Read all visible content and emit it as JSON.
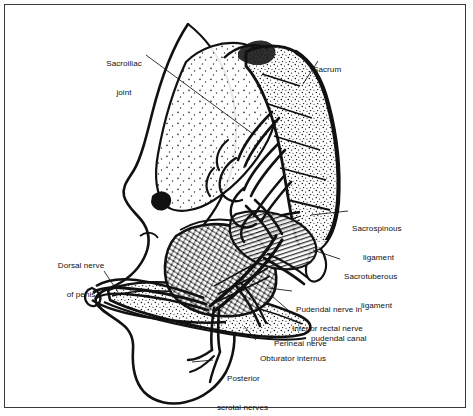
{
  "figure": {
    "kind": "anatomical-line-drawing",
    "title_visible": false,
    "palette": {
      "ink": "#111111",
      "paper": "#ffffff",
      "frame": "#3a3a3a"
    }
  },
  "labels": [
    {
      "id": "sacroiliac-joint",
      "line1": "Sacroiliac",
      "line2": "joint"
    },
    {
      "id": "sacrum",
      "line1": "Sacrum",
      "line2": ""
    },
    {
      "id": "sacrospinous-ligament",
      "line1": "Sacrospinous",
      "line2": "ligament"
    },
    {
      "id": "sacrotuberous-ligament",
      "line1": "Sacrotuberous",
      "line2": "ligament"
    },
    {
      "id": "dorsal-nerve-of-penis",
      "line1": "Dorsal nerve",
      "line2": "of penis"
    },
    {
      "id": "pudendal-nerve",
      "line1": "Pudendal nerve in",
      "line2": "pudendal canal"
    },
    {
      "id": "inferior-rectal-nerve",
      "line1": "Inferior rectal nerve",
      "line2": ""
    },
    {
      "id": "perineal-nerve",
      "line1": "Perineal nerve",
      "line2": ""
    },
    {
      "id": "obturator-internus",
      "line1": "Obturator internus",
      "line2": ""
    },
    {
      "id": "posterior-scrotal-nerves",
      "line1": "Posterior",
      "line2": "scrotal nerves"
    }
  ]
}
